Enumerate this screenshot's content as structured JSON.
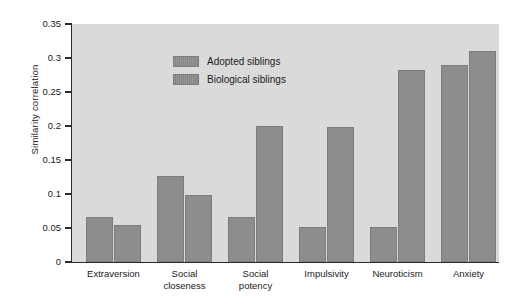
{
  "chart_data": {
    "type": "bar",
    "title": "",
    "xlabel": "",
    "ylabel": "Similarity correlation",
    "ylim": [
      0,
      0.35
    ],
    "yticks": [
      "0",
      "0.05",
      "0.1",
      "0.15",
      "0.2",
      "0.25",
      "0.3",
      "0.35"
    ],
    "ytick_values": [
      0,
      0.05,
      0.1,
      0.15,
      0.2,
      0.25,
      0.3,
      0.35
    ],
    "grid": false,
    "legend_position": "top-left inside plot",
    "categories": [
      [
        "Extraversion"
      ],
      [
        "Social",
        "closeness"
      ],
      [
        "Social",
        "potency"
      ],
      [
        "Impulsivity"
      ],
      [
        "Neuroticism"
      ],
      [
        "Anxiety"
      ]
    ],
    "series": [
      {
        "name": "Adopted siblings",
        "color": "#8d8d8d",
        "values": [
          0.066,
          0.127,
          0.066,
          0.052,
          0.052,
          0.289
        ]
      },
      {
        "name": "Biological siblings",
        "color": "#8d8d8d",
        "values": [
          0.055,
          0.098,
          0.2,
          0.198,
          0.282,
          0.311
        ]
      }
    ],
    "colors": {
      "plot_background": "#dcdcdc",
      "figure_background": "#ffffff",
      "bar_fill": "#8d8d8d",
      "bar_edge": "#7c7c7c",
      "axis": "#2b2b2b",
      "text": "#1a1a1a"
    }
  }
}
